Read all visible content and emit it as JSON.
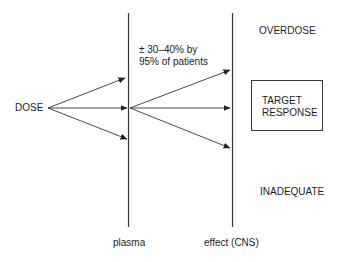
{
  "diagram": {
    "source_label": "DOSE",
    "axes": [
      {
        "label": "plasma"
      },
      {
        "label": "effect (CNS)"
      }
    ],
    "annotation": {
      "line1": "± 30–40% by",
      "line2": "95% of patients"
    },
    "outcomes": {
      "top": "OVERDOSE",
      "middle_line1": "TARGET",
      "middle_line2": "RESPONSE",
      "bottom": "INADEQUATE"
    },
    "colors": {
      "line": "#333333",
      "text": "#1e1e1e",
      "background": "#ffffff"
    }
  }
}
